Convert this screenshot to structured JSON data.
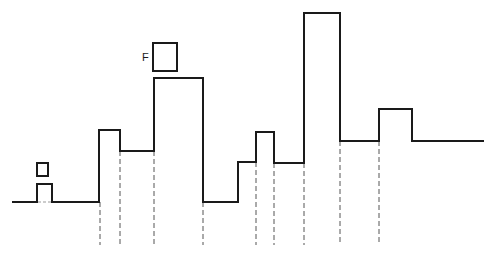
{
  "diagram": {
    "colors": {
      "stroke": "#1a1a1a",
      "dash": "#555555",
      "background": "#ffffff"
    },
    "waveform_points": [
      [
        12,
        202
      ],
      [
        37,
        202
      ],
      [
        37,
        184
      ],
      [
        52,
        184
      ],
      [
        52,
        202
      ],
      [
        99,
        202
      ],
      [
        99,
        130
      ],
      [
        120,
        130
      ],
      [
        120,
        151
      ],
      [
        154,
        151
      ],
      [
        154,
        78
      ],
      [
        203,
        78
      ],
      [
        203,
        202
      ],
      [
        238,
        202
      ],
      [
        238,
        162
      ],
      [
        256,
        162
      ],
      [
        256,
        132
      ],
      [
        274,
        132
      ],
      [
        274,
        163
      ],
      [
        304,
        163
      ],
      [
        304,
        13
      ],
      [
        340,
        13
      ],
      [
        340,
        141
      ],
      [
        379,
        141
      ],
      [
        379,
        109
      ],
      [
        412,
        109
      ],
      [
        412,
        141
      ],
      [
        484,
        141
      ]
    ],
    "dashed_lines": [
      {
        "x": 100,
        "y1": 202,
        "y2": 245
      },
      {
        "x": 120,
        "y1": 151,
        "y2": 245
      },
      {
        "x": 154,
        "y1": 151,
        "y2": 245
      },
      {
        "x": 203,
        "y1": 202,
        "y2": 245
      },
      {
        "x": 256,
        "y1": 162,
        "y2": 245
      },
      {
        "x": 274,
        "y1": 163,
        "y2": 245
      },
      {
        "x": 304,
        "y1": 163,
        "y2": 245
      },
      {
        "x": 340,
        "y1": 141,
        "y2": 245
      },
      {
        "x": 379,
        "y1": 141,
        "y2": 245
      }
    ],
    "small_bump_gap": {
      "x1": 38,
      "x2": 51,
      "y": 202
    },
    "markers": [
      {
        "id": "small-square",
        "x": 37,
        "y": 163,
        "w": 11,
        "h": 13,
        "label": ""
      },
      {
        "id": "f-square",
        "x": 153,
        "y": 43,
        "w": 24,
        "h": 28,
        "label": "F"
      }
    ],
    "f_label": "F"
  }
}
